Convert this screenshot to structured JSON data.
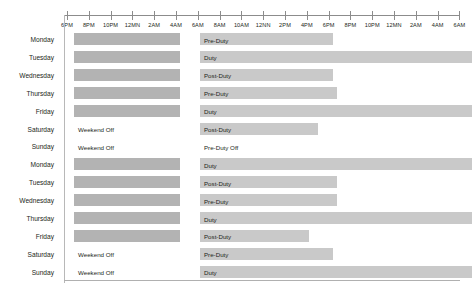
{
  "chart_data": {
    "type": "bar",
    "title": "",
    "xlabel": "",
    "ylabel": "",
    "grid": false,
    "legend": "none",
    "orientation": "horizontal",
    "axis": {
      "tick_labels": [
        "6PM",
        "8PM",
        "10PM",
        "12MN",
        "2AM",
        "4AM",
        "6AM",
        "8AM",
        "10AM",
        "12NN",
        "2PM",
        "4PM",
        "6PM",
        "8PM",
        "10PM",
        "12MN",
        "2AM",
        "4AM",
        "6AM"
      ],
      "unit_hours": 2,
      "x_start_hour": 18,
      "x_end_hour": 54
    },
    "colors": {
      "bar_dark": "#b3b3b3",
      "bar_light": "#c9c9c9",
      "axis": "#8c8c8c",
      "text": "#231f20",
      "background": "#ffffff"
    },
    "categories": [
      "Monday",
      "Tuesday",
      "Wednesday",
      "Thursday",
      "Friday",
      "Saturday",
      "Sunday",
      "Monday",
      "Tuesday",
      "Wednesday",
      "Thursday",
      "Friday",
      "Saturday",
      "Sunday"
    ],
    "rows": [
      {
        "day": "Monday",
        "rest_bar": {
          "start_hour": 18.6,
          "end_hour": 28.4,
          "label": ""
        },
        "duty_bar": {
          "start_hour": 30.2,
          "end_hour": 42.4,
          "label": "Pre-Duty"
        },
        "off_label": ""
      },
      {
        "day": "Tuesday",
        "rest_bar": {
          "start_hour": 18.6,
          "end_hour": 28.4,
          "label": ""
        },
        "duty_bar": {
          "start_hour": 30.2,
          "end_hour": 55.2,
          "label": "Duty"
        },
        "off_label": ""
      },
      {
        "day": "Wednesday",
        "rest_bar": {
          "start_hour": 18.6,
          "end_hour": 28.4,
          "label": ""
        },
        "duty_bar": {
          "start_hour": 30.2,
          "end_hour": 42.4,
          "label": "Post-Duty"
        },
        "off_label": ""
      },
      {
        "day": "Thursday",
        "rest_bar": {
          "start_hour": 18.6,
          "end_hour": 28.4,
          "label": ""
        },
        "duty_bar": {
          "start_hour": 30.2,
          "end_hour": 42.8,
          "label": "Pre-Duty"
        },
        "off_label": ""
      },
      {
        "day": "Friday",
        "rest_bar": {
          "start_hour": 18.6,
          "end_hour": 28.4,
          "label": ""
        },
        "duty_bar": {
          "start_hour": 30.2,
          "end_hour": 55.2,
          "label": "Duty"
        },
        "off_label": ""
      },
      {
        "day": "Saturday",
        "rest_bar": null,
        "duty_bar": {
          "start_hour": 30.2,
          "end_hour": 41.0,
          "label": "Post-Duty"
        },
        "off_label": "Weekend Off"
      },
      {
        "day": "Sunday",
        "rest_bar": null,
        "duty_bar": null,
        "duty_text": "Pre-Duty Off",
        "off_label": "Weekend Off"
      },
      {
        "day": "Monday",
        "rest_bar": {
          "start_hour": 18.6,
          "end_hour": 28.4,
          "label": ""
        },
        "duty_bar": {
          "start_hour": 30.2,
          "end_hour": 55.2,
          "label": "Duty"
        },
        "off_label": ""
      },
      {
        "day": "Tuesday",
        "rest_bar": {
          "start_hour": 18.6,
          "end_hour": 28.4,
          "label": ""
        },
        "duty_bar": {
          "start_hour": 30.2,
          "end_hour": 42.8,
          "label": "Post-Duty"
        },
        "off_label": ""
      },
      {
        "day": "Wednesday",
        "rest_bar": {
          "start_hour": 18.6,
          "end_hour": 28.4,
          "label": ""
        },
        "duty_bar": {
          "start_hour": 30.2,
          "end_hour": 42.8,
          "label": "Pre-Duty"
        },
        "off_label": ""
      },
      {
        "day": "Thursday",
        "rest_bar": {
          "start_hour": 18.6,
          "end_hour": 28.4,
          "label": ""
        },
        "duty_bar": {
          "start_hour": 30.2,
          "end_hour": 55.2,
          "label": "Duty"
        },
        "off_label": ""
      },
      {
        "day": "Friday",
        "rest_bar": {
          "start_hour": 18.6,
          "end_hour": 28.4,
          "label": ""
        },
        "duty_bar": {
          "start_hour": 30.2,
          "end_hour": 40.2,
          "label": "Post-Duty"
        },
        "off_label": ""
      },
      {
        "day": "Saturday",
        "rest_bar": null,
        "duty_bar": {
          "start_hour": 30.2,
          "end_hour": 42.4,
          "label": "Pre-Duty"
        },
        "off_label": "Weekend Off"
      },
      {
        "day": "Sunday",
        "rest_bar": null,
        "duty_bar": {
          "start_hour": 30.2,
          "end_hour": 55.2,
          "label": "Duty"
        },
        "off_label": "Weekend Off"
      }
    ]
  }
}
